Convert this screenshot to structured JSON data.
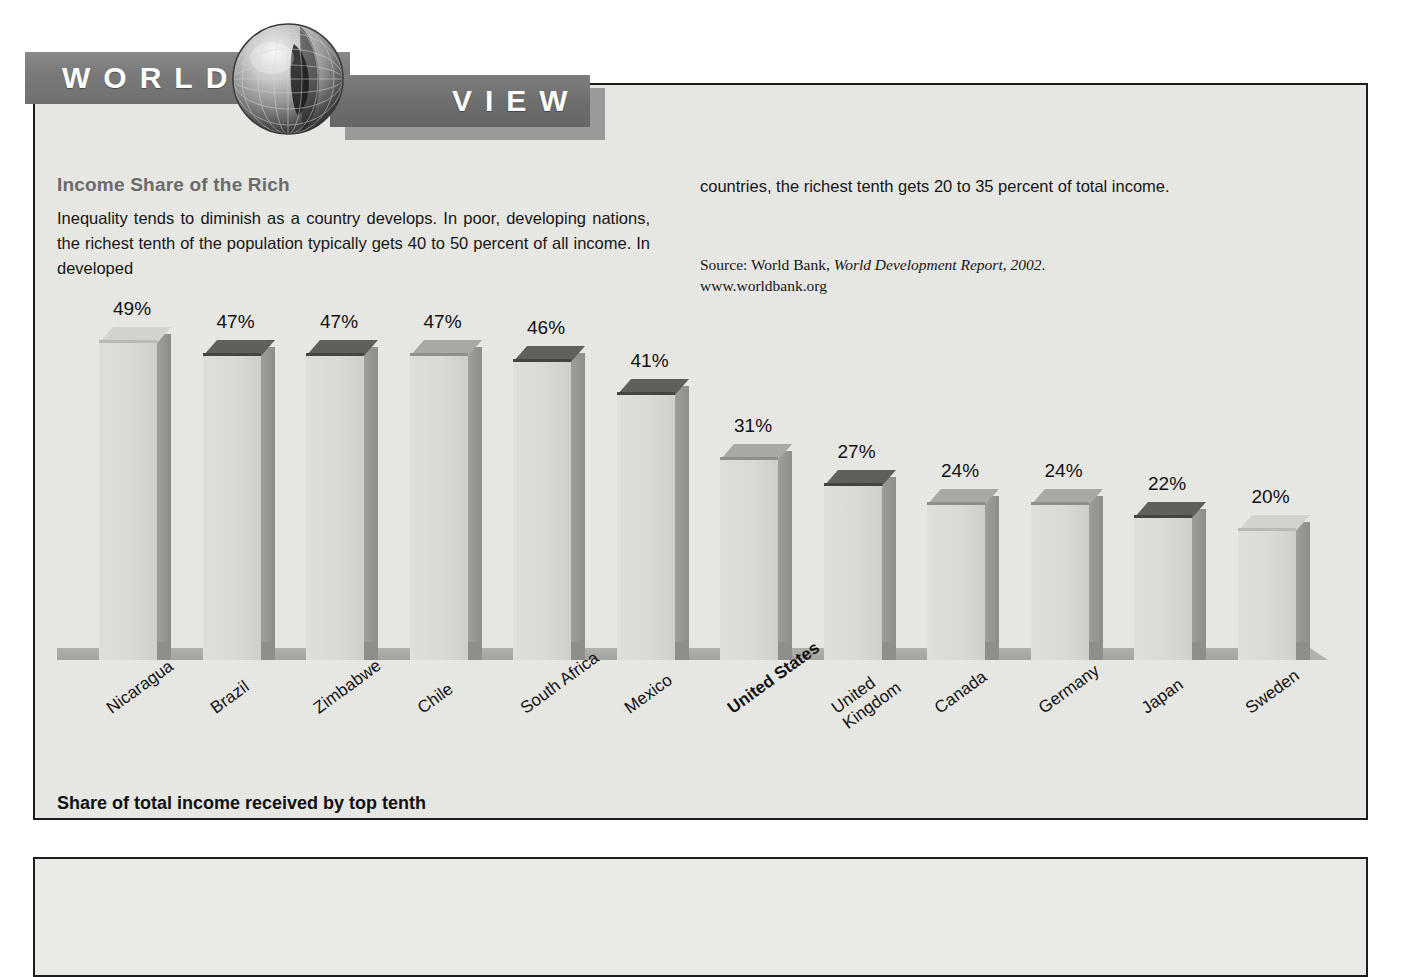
{
  "masthead": {
    "word_left": "WORLD",
    "word_right": "VIEW",
    "globe_icon": "globe-icon"
  },
  "article": {
    "title": "Income Share of the Rich",
    "body_left": "Inequality tends to diminish as a country develops. In poor, developing nations, the richest tenth of the population typically gets 40 to 50 percent of all income. In developed",
    "body_right": "countries, the richest tenth gets 20 to 35 percent of total income.",
    "source_prefix": "Source: World Bank, ",
    "source_title": "World Development Report, 2002",
    "source_suffix": ".",
    "source_url": "www.worldbank.org"
  },
  "caption": "Share of total income received by top tenth",
  "colors": {
    "panel_bg": "#e9e9e6",
    "masthead_bar": "#7b7b7b",
    "title_gray": "#6b6b6b",
    "bar_front": "#d9d9d5",
    "bar_side": "#93938f",
    "ground": "#a9a9a6"
  },
  "chart_data": {
    "type": "bar",
    "title": "Income Share of the Rich",
    "subtitle": "Share of total income received by top tenth",
    "xlabel": "",
    "ylabel": "Share of total income received by top tenth",
    "ylim": [
      0,
      49
    ],
    "grid": false,
    "legend": "none",
    "value_suffix": "%",
    "categories": [
      "Nicaragua",
      "Brazil",
      "Zimbabwe",
      "Chile",
      "South Africa",
      "Mexico",
      "United States",
      "United Kingdom",
      "Canada",
      "Germany",
      "Japan",
      "Sweden"
    ],
    "values": [
      49,
      47,
      47,
      47,
      46,
      41,
      31,
      27,
      24,
      24,
      22,
      20
    ],
    "value_labels": [
      "49%",
      "47%",
      "47%",
      "47%",
      "46%",
      "41%",
      "31%",
      "27%",
      "24%",
      "24%",
      "22%",
      "20%"
    ],
    "highlighted": "United States",
    "bars": [
      {
        "label": "Nicaragua",
        "label_lines": [
          "Nicaragua"
        ],
        "value": 49,
        "value_label": "49%",
        "top_shade": "light",
        "bold": false
      },
      {
        "label": "Brazil",
        "label_lines": [
          "Brazil"
        ],
        "value": 47,
        "value_label": "47%",
        "top_shade": "dark",
        "bold": false
      },
      {
        "label": "Zimbabwe",
        "label_lines": [
          "Zimbabwe"
        ],
        "value": 47,
        "value_label": "47%",
        "top_shade": "dark",
        "bold": false
      },
      {
        "label": "Chile",
        "label_lines": [
          "Chile"
        ],
        "value": 47,
        "value_label": "47%",
        "top_shade": "mid",
        "bold": false
      },
      {
        "label": "South Africa",
        "label_lines": [
          "South Africa"
        ],
        "value": 46,
        "value_label": "46%",
        "top_shade": "dark",
        "bold": false
      },
      {
        "label": "Mexico",
        "label_lines": [
          "Mexico"
        ],
        "value": 41,
        "value_label": "41%",
        "top_shade": "dark",
        "bold": false
      },
      {
        "label": "United States",
        "label_lines": [
          "United States"
        ],
        "value": 31,
        "value_label": "31%",
        "top_shade": "mid",
        "bold": true
      },
      {
        "label": "United Kingdom",
        "label_lines": [
          "United",
          "Kingdom"
        ],
        "value": 27,
        "value_label": "27%",
        "top_shade": "dark",
        "bold": false
      },
      {
        "label": "Canada",
        "label_lines": [
          "Canada"
        ],
        "value": 24,
        "value_label": "24%",
        "top_shade": "mid",
        "bold": false
      },
      {
        "label": "Germany",
        "label_lines": [
          "Germany"
        ],
        "value": 24,
        "value_label": "24%",
        "top_shade": "mid",
        "bold": false
      },
      {
        "label": "Japan",
        "label_lines": [
          "Japan"
        ],
        "value": 22,
        "value_label": "22%",
        "top_shade": "dark",
        "bold": false
      },
      {
        "label": "Sweden",
        "label_lines": [
          "Sweden"
        ],
        "value": 20,
        "value_label": "20%",
        "top_shade": "light",
        "bold": false
      }
    ]
  }
}
